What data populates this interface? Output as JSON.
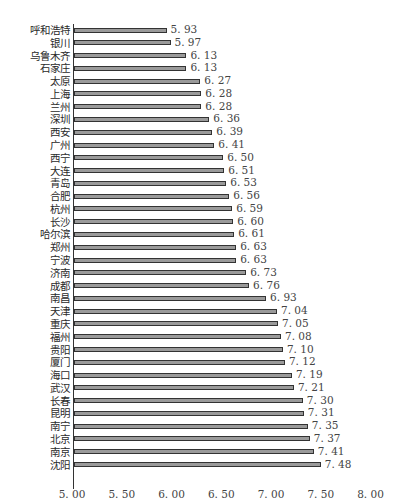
{
  "chart_data": {
    "type": "bar",
    "orientation": "horizontal",
    "title": "",
    "caption": "图 2.7   2017 年中国城市水安全性得分排名",
    "xlabel": "",
    "ylabel": "",
    "xlim": [
      5.0,
      8.0
    ],
    "x_ticks": [
      "5.00",
      "5.50",
      "6.00",
      "6.50",
      "7.00",
      "7.50",
      "8.00"
    ],
    "grid": false,
    "legend": null,
    "categories": [
      "呼和浩特",
      "银川",
      "乌鲁木齐",
      "石家庄",
      "太原",
      "上海",
      "兰州",
      "深圳",
      "西安",
      "广州",
      "西宁",
      "大连",
      "青岛",
      "合肥",
      "杭州",
      "长沙",
      "哈尔滨",
      "郑州",
      "宁波",
      "济南",
      "成都",
      "南昌",
      "天津",
      "重庆",
      "福州",
      "贵阳",
      "厦门",
      "海口",
      "武汉",
      "长春",
      "昆明",
      "南宁",
      "北京",
      "南京",
      "沈阳"
    ],
    "values": [
      5.93,
      5.97,
      6.13,
      6.13,
      6.27,
      6.28,
      6.28,
      6.36,
      6.39,
      6.41,
      6.5,
      6.51,
      6.53,
      6.56,
      6.59,
      6.6,
      6.61,
      6.63,
      6.63,
      6.73,
      6.76,
      6.93,
      7.04,
      7.05,
      7.08,
      7.1,
      7.12,
      7.19,
      7.21,
      7.3,
      7.31,
      7.35,
      7.37,
      7.41,
      7.48
    ],
    "value_labels": [
      "5. 93",
      "5. 97",
      "6. 13",
      "6. 13",
      "6. 27",
      "6. 28",
      "6. 28",
      "6. 36",
      "6. 39",
      "6. 41",
      "6. 50",
      "6. 51",
      "6. 53",
      "6. 56",
      "6. 59",
      "6. 60",
      "6. 61",
      "6. 63",
      "6. 63",
      "6. 73",
      "6. 76",
      "6. 93",
      "7. 04",
      "7. 05",
      "7. 08",
      "7. 10",
      "7. 12",
      "7. 19",
      "7. 21",
      "7. 30",
      "7. 31",
      "7. 35",
      "7. 37",
      "7. 41",
      "7. 48"
    ],
    "tick_labels": [
      "5. 00",
      "5. 50",
      "6. 00",
      "6. 50",
      "7. 00",
      "7. 50",
      "8. 00"
    ],
    "bar_color": "#9a9a9a",
    "bar_border_color": "#333333"
  }
}
